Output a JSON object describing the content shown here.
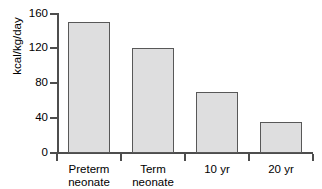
{
  "chart_data": {
    "type": "bar",
    "title": "",
    "subtitle": "",
    "xlabel": "",
    "ylabel": "kcal/kg/day",
    "categories": [
      "Preterm neonate",
      "Term neonate",
      "10 yr",
      "20 yr"
    ],
    "category_lines": [
      [
        "Preterm",
        "neonate"
      ],
      [
        "Term",
        "neonate"
      ],
      [
        "10 yr"
      ],
      [
        "20 yr"
      ]
    ],
    "values": [
      150,
      120,
      70,
      35
    ],
    "ylim": [
      0,
      160
    ],
    "yticks": [
      0,
      40,
      80,
      120,
      160
    ],
    "ytick_labels": [
      "0",
      "40",
      "80",
      "120",
      "160"
    ],
    "grid": false,
    "legend": false,
    "legend_position": "none",
    "colors": {
      "bar_fill": "#dededf",
      "bar_border": "#585858",
      "axis": "#4d4d4d",
      "text": "#000000",
      "background": "#ffffff"
    }
  }
}
